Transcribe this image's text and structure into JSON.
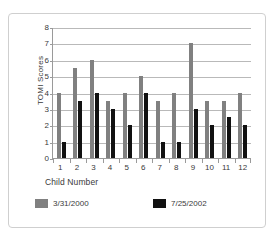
{
  "chart_data": {
    "type": "bar",
    "title": "",
    "xlabel": "Child Number",
    "ylabel": "TOMI Scores",
    "categories": [
      "1",
      "2",
      "3",
      "4",
      "5",
      "6",
      "7",
      "8",
      "9",
      "10",
      "11",
      "12"
    ],
    "ylim": [
      0,
      8
    ],
    "yticks": [
      0,
      1,
      2,
      3,
      4,
      5,
      6,
      7,
      8
    ],
    "grid": true,
    "legend_position": "bottom",
    "series": [
      {
        "name": "3/31/2000",
        "color": "#808080",
        "values": [
          4,
          5.5,
          6,
          3.5,
          4,
          5,
          3.5,
          4,
          7,
          3.5,
          3.5,
          4
        ]
      },
      {
        "name": "7/25/2002",
        "color": "#111111",
        "values": [
          1,
          3.5,
          4,
          3,
          2,
          4,
          1,
          1,
          3,
          2,
          2.5,
          2
        ]
      }
    ]
  }
}
